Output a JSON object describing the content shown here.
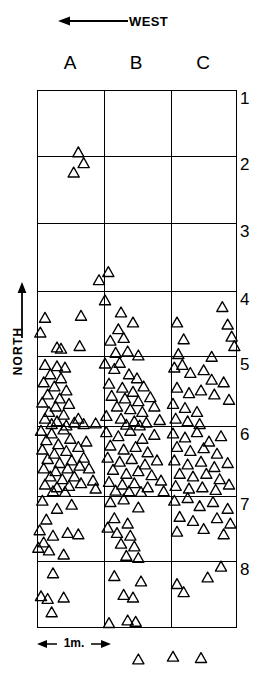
{
  "figure": {
    "type": "archaeological-artifact-distribution-map",
    "west_indicator": {
      "label": "WEST",
      "arrow_direction": "left",
      "icon": "arrow-left-icon"
    },
    "north_indicator": {
      "label": "NORTH",
      "arrow_direction": "up",
      "icon": "arrow-up-icon"
    },
    "scale_bar": {
      "label": "1m.",
      "spans_columns": 1,
      "left_cap": "arrow-left-icon",
      "right_cap": "arrow-right-icon"
    },
    "grid": {
      "columns": [
        "A",
        "B",
        "C"
      ],
      "rows": [
        "1",
        "2",
        "3",
        "4",
        "5",
        "6",
        "7",
        "8"
      ],
      "line_color": "#000000",
      "background": "#ffffff"
    },
    "symbol": {
      "shape": "triangle",
      "fill": "none",
      "stroke": "#000000",
      "meaning": "artifact find"
    }
  },
  "chart_data": {
    "type": "scatter",
    "title": "",
    "xlabel": "",
    "ylabel": "",
    "xlim": [
      0,
      3
    ],
    "ylim": [
      0,
      8
    ],
    "grid": true,
    "x_categories": [
      "A",
      "B",
      "C"
    ],
    "y_categories": [
      "1",
      "2",
      "3",
      "4",
      "5",
      "6",
      "7",
      "8"
    ],
    "marker": "triangle-up-open",
    "counts_by_cell": {
      "A1": 1,
      "B1": 0,
      "C1": 0,
      "A2": 2,
      "B2": 2,
      "C2": 0,
      "A3": 6,
      "B3": 9,
      "C3": 8,
      "A4": 22,
      "B4": 21,
      "C4": 11,
      "A5": 30,
      "B5": 28,
      "C5": 17,
      "A6": 20,
      "B6": 26,
      "C6": 22,
      "A7": 5,
      "B7": 7,
      "C7": 4,
      "A8": 0,
      "B8": 1,
      "C8": 2
    },
    "total_count": 244,
    "points": [
      [
        0.62,
        0.92
      ],
      [
        0.7,
        1.08
      ],
      [
        0.55,
        1.22
      ],
      [
        0.93,
        2.82
      ],
      [
        1.07,
        2.7
      ],
      [
        0.12,
        3.38
      ],
      [
        0.05,
        3.6
      ],
      [
        0.3,
        3.82
      ],
      [
        0.36,
        3.84
      ],
      [
        0.66,
        3.35
      ],
      [
        0.64,
        3.8
      ],
      [
        1.02,
        3.12
      ],
      [
        1.22,
        3.55
      ],
      [
        1.1,
        3.72
      ],
      [
        1.3,
        3.68
      ],
      [
        1.44,
        3.45
      ],
      [
        1.36,
        3.88
      ],
      [
        1.18,
        3.9
      ],
      [
        1.52,
        3.94
      ],
      [
        1.26,
        3.3
      ],
      [
        2.1,
        3.45
      ],
      [
        2.2,
        3.7
      ],
      [
        2.12,
        3.92
      ],
      [
        2.78,
        3.22
      ],
      [
        2.86,
        3.48
      ],
      [
        2.92,
        3.66
      ],
      [
        2.96,
        3.8
      ],
      [
        2.62,
        3.96
      ],
      [
        0.12,
        4.08
      ],
      [
        0.3,
        4.1
      ],
      [
        0.42,
        4.12
      ],
      [
        0.2,
        4.22
      ],
      [
        0.36,
        4.28
      ],
      [
        0.1,
        4.34
      ],
      [
        0.26,
        4.4
      ],
      [
        0.44,
        4.46
      ],
      [
        0.16,
        4.52
      ],
      [
        0.34,
        4.58
      ],
      [
        0.08,
        4.64
      ],
      [
        0.28,
        4.7
      ],
      [
        0.48,
        4.66
      ],
      [
        0.18,
        4.78
      ],
      [
        0.4,
        4.82
      ],
      [
        0.12,
        4.88
      ],
      [
        0.3,
        4.92
      ],
      [
        0.56,
        4.94
      ],
      [
        0.22,
        4.96
      ],
      [
        0.44,
        4.98
      ],
      [
        0.62,
        4.88
      ],
      [
        0.7,
        4.96
      ],
      [
        0.88,
        4.95
      ],
      [
        1.02,
        4.06
      ],
      [
        1.16,
        4.14
      ],
      [
        1.24,
        4.05
      ],
      [
        1.38,
        4.22
      ],
      [
        1.5,
        4.28
      ],
      [
        1.08,
        4.36
      ],
      [
        1.28,
        4.42
      ],
      [
        1.44,
        4.48
      ],
      [
        1.6,
        4.4
      ],
      [
        1.12,
        4.54
      ],
      [
        1.32,
        4.58
      ],
      [
        1.52,
        4.62
      ],
      [
        1.7,
        4.56
      ],
      [
        1.2,
        4.7
      ],
      [
        1.4,
        4.74
      ],
      [
        1.58,
        4.78
      ],
      [
        1.76,
        4.7
      ],
      [
        1.04,
        4.84
      ],
      [
        1.26,
        4.88
      ],
      [
        1.46,
        4.92
      ],
      [
        1.64,
        4.94
      ],
      [
        1.84,
        4.9
      ],
      [
        1.34,
        4.97
      ],
      [
        1.54,
        4.98
      ],
      [
        2.06,
        4.12
      ],
      [
        2.18,
        4.08
      ],
      [
        2.3,
        4.2
      ],
      [
        2.5,
        4.16
      ],
      [
        2.62,
        4.3
      ],
      [
        2.1,
        4.42
      ],
      [
        2.28,
        4.5
      ],
      [
        2.46,
        4.46
      ],
      [
        2.66,
        4.52
      ],
      [
        2.04,
        4.66
      ],
      [
        2.22,
        4.72
      ],
      [
        2.4,
        4.78
      ],
      [
        2.08,
        4.88
      ],
      [
        2.26,
        4.92
      ],
      [
        2.44,
        4.96
      ],
      [
        2.8,
        4.34
      ],
      [
        2.88,
        4.6
      ],
      [
        0.06,
        5.06
      ],
      [
        0.22,
        5.1
      ],
      [
        0.4,
        5.04
      ],
      [
        0.14,
        5.2
      ],
      [
        0.32,
        5.26
      ],
      [
        0.5,
        5.18
      ],
      [
        0.08,
        5.34
      ],
      [
        0.26,
        5.4
      ],
      [
        0.44,
        5.36
      ],
      [
        0.62,
        5.3
      ],
      [
        0.16,
        5.48
      ],
      [
        0.34,
        5.54
      ],
      [
        0.52,
        5.5
      ],
      [
        0.7,
        5.46
      ],
      [
        0.1,
        5.62
      ],
      [
        0.28,
        5.66
      ],
      [
        0.46,
        5.62
      ],
      [
        0.64,
        5.58
      ],
      [
        0.2,
        5.74
      ],
      [
        0.38,
        5.78
      ],
      [
        0.56,
        5.74
      ],
      [
        0.12,
        5.86
      ],
      [
        0.3,
        5.9
      ],
      [
        0.48,
        5.88
      ],
      [
        0.66,
        5.84
      ],
      [
        0.24,
        5.96
      ],
      [
        0.42,
        5.97
      ],
      [
        0.78,
        5.62
      ],
      [
        0.84,
        5.8
      ],
      [
        0.88,
        5.92
      ],
      [
        0.74,
        5.22
      ],
      [
        1.04,
        5.08
      ],
      [
        1.22,
        5.14
      ],
      [
        1.4,
        5.06
      ],
      [
        1.58,
        5.18
      ],
      [
        1.76,
        5.12
      ],
      [
        1.1,
        5.28
      ],
      [
        1.3,
        5.34
      ],
      [
        1.48,
        5.3
      ],
      [
        1.66,
        5.38
      ],
      [
        1.06,
        5.46
      ],
      [
        1.24,
        5.52
      ],
      [
        1.42,
        5.48
      ],
      [
        1.62,
        5.56
      ],
      [
        1.8,
        5.5
      ],
      [
        1.14,
        5.64
      ],
      [
        1.34,
        5.7
      ],
      [
        1.52,
        5.66
      ],
      [
        1.72,
        5.72
      ],
      [
        1.08,
        5.82
      ],
      [
        1.28,
        5.86
      ],
      [
        1.46,
        5.84
      ],
      [
        1.66,
        5.9
      ],
      [
        1.86,
        5.8
      ],
      [
        1.18,
        5.95
      ],
      [
        1.38,
        5.96
      ],
      [
        1.56,
        5.97
      ],
      [
        1.9,
        5.96
      ],
      [
        2.04,
        5.1
      ],
      [
        2.22,
        5.16
      ],
      [
        2.4,
        5.08
      ],
      [
        2.58,
        5.22
      ],
      [
        2.76,
        5.14
      ],
      [
        2.1,
        5.3
      ],
      [
        2.3,
        5.36
      ],
      [
        2.5,
        5.32
      ],
      [
        2.7,
        5.4
      ],
      [
        2.06,
        5.5
      ],
      [
        2.26,
        5.56
      ],
      [
        2.46,
        5.52
      ],
      [
        2.66,
        5.6
      ],
      [
        2.86,
        5.54
      ],
      [
        2.14,
        5.7
      ],
      [
        2.34,
        5.74
      ],
      [
        2.54,
        5.7
      ],
      [
        2.74,
        5.78
      ],
      [
        2.08,
        5.88
      ],
      [
        2.28,
        5.92
      ],
      [
        2.48,
        5.9
      ],
      [
        2.68,
        5.94
      ],
      [
        2.88,
        5.86
      ],
      [
        0.08,
        6.1
      ],
      [
        0.3,
        6.22
      ],
      [
        0.52,
        6.16
      ],
      [
        0.14,
        6.38
      ],
      [
        0.04,
        6.54
      ],
      [
        0.24,
        6.62
      ],
      [
        0.46,
        6.58
      ],
      [
        0.1,
        6.72
      ],
      [
        0.02,
        6.8
      ],
      [
        0.18,
        6.84
      ],
      [
        0.62,
        6.6
      ],
      [
        0.4,
        6.9
      ],
      [
        1.1,
        6.12
      ],
      [
        1.3,
        6.08
      ],
      [
        1.52,
        6.2
      ],
      [
        1.16,
        6.36
      ],
      [
        1.36,
        6.44
      ],
      [
        1.2,
        6.58
      ],
      [
        1.4,
        6.62
      ],
      [
        1.26,
        6.74
      ],
      [
        1.46,
        6.78
      ],
      [
        1.34,
        6.92
      ],
      [
        1.52,
        6.95
      ],
      [
        1.06,
        6.5
      ],
      [
        2.06,
        6.1
      ],
      [
        2.26,
        6.06
      ],
      [
        2.44,
        6.18
      ],
      [
        2.64,
        6.12
      ],
      [
        2.86,
        6.22
      ],
      [
        2.14,
        6.34
      ],
      [
        2.34,
        6.4
      ],
      [
        2.7,
        6.36
      ],
      [
        2.9,
        6.44
      ],
      [
        2.1,
        6.56
      ],
      [
        2.5,
        6.52
      ],
      [
        2.8,
        6.6
      ],
      [
        0.24,
        7.18
      ],
      [
        0.06,
        7.52
      ],
      [
        0.16,
        7.56
      ],
      [
        0.4,
        7.54
      ],
      [
        0.22,
        7.76
      ],
      [
        1.16,
        7.22
      ],
      [
        1.3,
        7.5
      ],
      [
        1.44,
        7.54
      ],
      [
        1.36,
        7.88
      ],
      [
        1.48,
        7.9
      ],
      [
        1.08,
        7.92
      ],
      [
        1.56,
        7.3
      ],
      [
        2.1,
        7.34
      ],
      [
        2.56,
        7.24
      ],
      [
        2.76,
        7.08
      ],
      [
        2.2,
        7.46
      ],
      [
        1.52,
        8.46
      ],
      [
        2.04,
        8.42
      ],
      [
        2.46,
        8.44
      ]
    ]
  }
}
